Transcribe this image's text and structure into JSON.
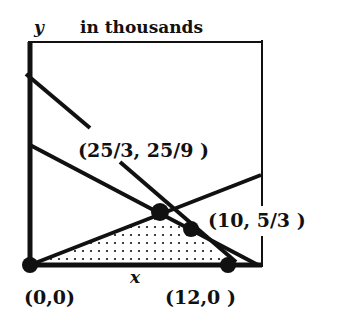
{
  "title": "in thousands",
  "axes": {
    "x_label": "x",
    "y_label": "y"
  },
  "colors": {
    "ink": "#111111",
    "background": "#ffffff"
  },
  "feasible_region": {
    "shading": "dotted",
    "vertices": [
      [
        0,
        0
      ],
      [
        8.3333,
        2.7778
      ],
      [
        10,
        1.6667
      ],
      [
        12,
        0
      ]
    ]
  },
  "lines": [
    {
      "name": "steep-constraint"
    },
    {
      "name": "shallow-constraint"
    },
    {
      "name": "rising-constraint"
    }
  ],
  "points": [
    {
      "label": "(0,0)",
      "x": 0,
      "y": 0
    },
    {
      "label": "(25/3, 25/9 )",
      "x": 8.3333,
      "y": 2.7778
    },
    {
      "label": "(10, 5/3 )",
      "x": 10,
      "y": 1.6667
    },
    {
      "label": "(12,0 )",
      "x": 12,
      "y": 0
    }
  ]
}
